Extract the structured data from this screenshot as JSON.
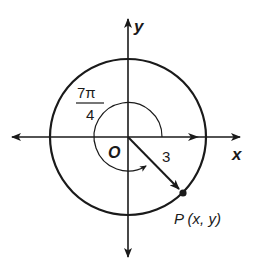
{
  "diagram": {
    "type": "unit-circle-angle",
    "axes": {
      "x_label": "x",
      "y_label": "y",
      "origin_label": "O"
    },
    "circle": {
      "radius_label": "3"
    },
    "angle": {
      "numerator": "7π",
      "denominator": "4",
      "direction": "clockwise"
    },
    "point": {
      "label": "P (x, y)"
    }
  }
}
